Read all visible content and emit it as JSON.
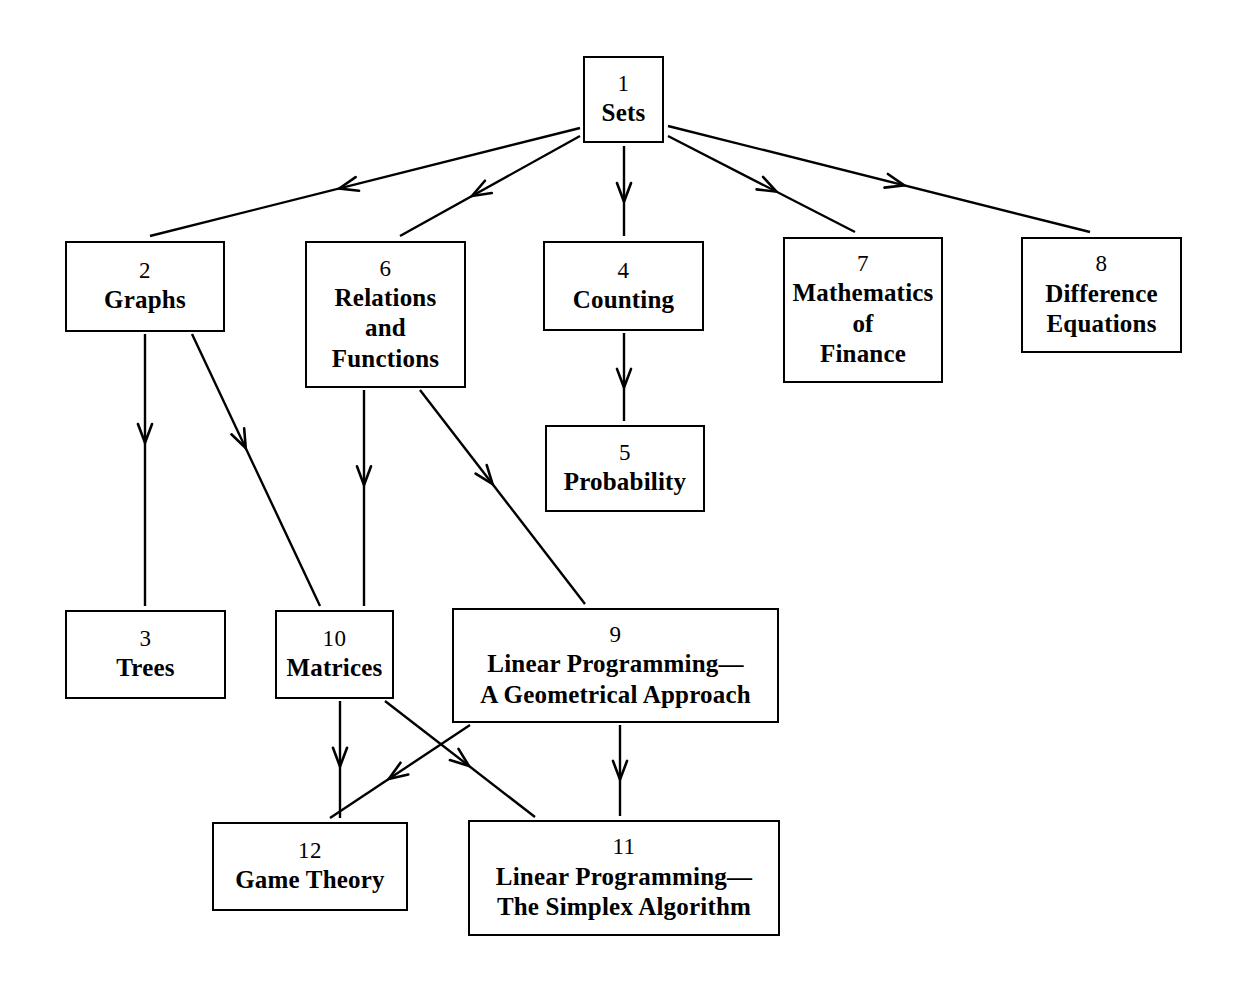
{
  "diagram": {
    "kind": "chapter-dependency-flowchart",
    "background_color": "#ffffff",
    "line_color": "#000000",
    "nodes": [
      {
        "id": "n1",
        "number": "1",
        "title": "Sets",
        "x": 583,
        "y": 56,
        "w": 81,
        "h": 87
      },
      {
        "id": "n2",
        "number": "2",
        "title": "Graphs",
        "x": 65,
        "y": 241,
        "w": 160,
        "h": 91
      },
      {
        "id": "n6",
        "number": "6",
        "title": "Relations\nand\nFunctions",
        "x": 305,
        "y": 241,
        "w": 161,
        "h": 147
      },
      {
        "id": "n4",
        "number": "4",
        "title": "Counting",
        "x": 543,
        "y": 241,
        "w": 161,
        "h": 90
      },
      {
        "id": "n7",
        "number": "7",
        "title": "Mathematics\nof\nFinance",
        "x": 783,
        "y": 237,
        "w": 160,
        "h": 146
      },
      {
        "id": "n8",
        "number": "8",
        "title": "Difference\nEquations",
        "x": 1021,
        "y": 237,
        "w": 161,
        "h": 116
      },
      {
        "id": "n5",
        "number": "5",
        "title": "Probability",
        "x": 545,
        "y": 425,
        "w": 160,
        "h": 87
      },
      {
        "id": "n3",
        "number": "3",
        "title": "Trees",
        "x": 65,
        "y": 610,
        "w": 161,
        "h": 89
      },
      {
        "id": "n10",
        "number": "10",
        "title": "Matrices",
        "x": 275,
        "y": 610,
        "w": 119,
        "h": 89
      },
      {
        "id": "n9",
        "number": "9",
        "title": "Linear Programming—\nA Geometrical Approach",
        "x": 452,
        "y": 608,
        "w": 327,
        "h": 115
      },
      {
        "id": "n12",
        "number": "12",
        "title": "Game Theory",
        "x": 212,
        "y": 822,
        "w": 196,
        "h": 89
      },
      {
        "id": "n11",
        "number": "11",
        "title": "Linear Programming—\nThe Simplex Algorithm",
        "x": 468,
        "y": 820,
        "w": 312,
        "h": 116
      }
    ],
    "edges": [
      {
        "id": "e1-2",
        "from": "n1",
        "to": "n2",
        "x1": 580,
        "y1": 128,
        "x2": 150,
        "y2": 236,
        "arrow_t": 0.56
      },
      {
        "id": "e1-6",
        "from": "n1",
        "to": "n6",
        "x1": 580,
        "y1": 136,
        "x2": 400,
        "y2": 236,
        "arrow_t": 0.6
      },
      {
        "id": "e1-4",
        "from": "n1",
        "to": "n4",
        "x1": 624,
        "y1": 146,
        "x2": 624,
        "y2": 236,
        "arrow_t": 0.62
      },
      {
        "id": "e1-7",
        "from": "n1",
        "to": "n7",
        "x1": 668,
        "y1": 136,
        "x2": 855,
        "y2": 232,
        "arrow_t": 0.58
      },
      {
        "id": "e1-8",
        "from": "n1",
        "to": "n8",
        "x1": 668,
        "y1": 126,
        "x2": 1090,
        "y2": 232,
        "arrow_t": 0.56
      },
      {
        "id": "e4-5",
        "from": "n4",
        "to": "n5",
        "x1": 624,
        "y1": 333,
        "x2": 624,
        "y2": 421,
        "arrow_t": 0.62
      },
      {
        "id": "e2-3",
        "from": "n2",
        "to": "n3",
        "x1": 145,
        "y1": 334,
        "x2": 145,
        "y2": 606,
        "arrow_t": 0.4
      },
      {
        "id": "e2-10",
        "from": "n2",
        "to": "n10",
        "x1": 192,
        "y1": 334,
        "x2": 320,
        "y2": 606,
        "arrow_t": 0.42
      },
      {
        "id": "e6-10",
        "from": "n6",
        "to": "n10",
        "x1": 364,
        "y1": 390,
        "x2": 364,
        "y2": 606,
        "arrow_t": 0.44
      },
      {
        "id": "e6-9",
        "from": "n6",
        "to": "n9",
        "x1": 420,
        "y1": 390,
        "x2": 585,
        "y2": 604,
        "arrow_t": 0.44
      },
      {
        "id": "e10-12",
        "from": "n10",
        "to": "n12",
        "x1": 340,
        "y1": 701,
        "x2": 340,
        "y2": 818,
        "arrow_t": 0.56
      },
      {
        "id": "e10-11",
        "from": "n10",
        "to": "n11",
        "x1": 385,
        "y1": 701,
        "x2": 535,
        "y2": 817,
        "arrow_t": 0.56
      },
      {
        "id": "e9-12",
        "from": "n9",
        "to": "n12",
        "x1": 470,
        "y1": 725,
        "x2": 330,
        "y2": 818,
        "arrow_t": 0.58
      },
      {
        "id": "e9-11",
        "from": "n9",
        "to": "n11",
        "x1": 620,
        "y1": 725,
        "x2": 620,
        "y2": 816,
        "arrow_t": 0.6
      }
    ]
  }
}
